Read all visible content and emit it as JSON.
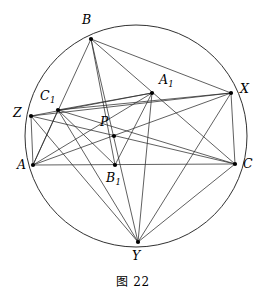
{
  "figure": {
    "caption": "图 22",
    "canvas": {
      "width": 266,
      "height": 304
    },
    "stroke_color": "#2b2b2b",
    "circle_color": "#1a1a1a",
    "dot_color": "#000000",
    "background": "#ffffff"
  },
  "circle": {
    "name": "circumcircle",
    "cx": 136,
    "cy": 136,
    "r": 111
  },
  "points": {
    "A": {
      "label": "A",
      "sub": "",
      "x": 33,
      "y": 165,
      "lx": 17,
      "ly": 159
    },
    "B": {
      "label": "B",
      "sub": "",
      "x": 91,
      "y": 39,
      "lx": 82,
      "ly": 14
    },
    "C": {
      "label": "C",
      "sub": "",
      "x": 235,
      "y": 164,
      "lx": 243,
      "ly": 158
    },
    "A1": {
      "label": "A",
      "sub": "1",
      "x": 152,
      "y": 93,
      "lx": 159,
      "ly": 74
    },
    "B1": {
      "label": "B",
      "sub": "1",
      "x": 115,
      "y": 165,
      "lx": 106,
      "ly": 172
    },
    "C1": {
      "label": "C",
      "sub": "1",
      "x": 58,
      "y": 110,
      "lx": 40,
      "ly": 90
    },
    "P": {
      "label": "P",
      "sub": "",
      "x": 114,
      "y": 136,
      "lx": 100,
      "ly": 116
    },
    "X": {
      "label": "X",
      "sub": "",
      "x": 231,
      "y": 93,
      "lx": 240,
      "ly": 83
    },
    "Y": {
      "label": "Y",
      "sub": "",
      "x": 138,
      "y": 242,
      "lx": 132,
      "ly": 250
    },
    "Z": {
      "label": "Z",
      "sub": "",
      "x": 31,
      "y": 116,
      "lx": 13,
      "ly": 107
    }
  },
  "segments": [
    {
      "name": "segment-A-B",
      "from": "A",
      "to": "B"
    },
    {
      "name": "segment-A-C",
      "from": "A",
      "to": "C"
    },
    {
      "name": "segment-B-C",
      "from": "B",
      "to": "C"
    },
    {
      "name": "segment-A-A1",
      "from": "A",
      "to": "A1"
    },
    {
      "name": "segment-B-B1",
      "from": "B",
      "to": "B1"
    },
    {
      "name": "segment-C-C1",
      "from": "C",
      "to": "C1"
    },
    {
      "name": "segment-A1-B1",
      "from": "A1",
      "to": "B1"
    },
    {
      "name": "segment-B1-C1",
      "from": "B1",
      "to": "C1"
    },
    {
      "name": "segment-C1-A1",
      "from": "C1",
      "to": "A1"
    },
    {
      "name": "segment-A-X",
      "from": "A",
      "to": "X"
    },
    {
      "name": "segment-B-X",
      "from": "B",
      "to": "X"
    },
    {
      "name": "segment-C-X",
      "from": "C",
      "to": "X"
    },
    {
      "name": "segment-B-Y",
      "from": "B",
      "to": "Y"
    },
    {
      "name": "segment-C-Y",
      "from": "C",
      "to": "Y"
    },
    {
      "name": "segment-Z-Y",
      "from": "Z",
      "to": "Y"
    },
    {
      "name": "segment-Z-A",
      "from": "Z",
      "to": "A"
    },
    {
      "name": "segment-Z-C",
      "from": "Z",
      "to": "C"
    },
    {
      "name": "segment-Z-X",
      "from": "Z",
      "to": "X"
    },
    {
      "name": "segment-Z-A1",
      "from": "Z",
      "to": "A1"
    },
    {
      "name": "segment-X-Y",
      "from": "X",
      "to": "Y"
    },
    {
      "name": "segment-X-C1",
      "from": "X",
      "to": "C1"
    },
    {
      "name": "segment-Y-C1",
      "from": "Y",
      "to": "C1"
    },
    {
      "name": "segment-Y-A1",
      "from": "Y",
      "to": "A1"
    },
    {
      "name": "segment-C1-A",
      "from": "C1",
      "to": "A"
    }
  ],
  "vertex_order": [
    "A",
    "B",
    "C",
    "A1",
    "B1",
    "C1",
    "P",
    "X",
    "Y",
    "Z"
  ]
}
